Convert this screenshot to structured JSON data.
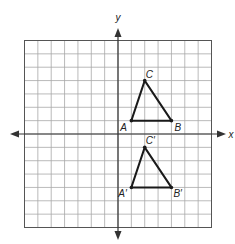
{
  "diagram": {
    "type": "coordinate-plane-transformation",
    "grid": {
      "x_min": -7,
      "x_max": 7,
      "y_min": -7,
      "y_max": 7,
      "cell_px": 13.357,
      "origin_px": [
        118,
        134
      ]
    },
    "axes": {
      "x_label": "x",
      "y_label": "y"
    },
    "colors": {
      "grid": "#a8a8a8",
      "axis": "#333333",
      "triangle": "#1a1a1a"
    },
    "figures": [
      {
        "name": "triangle-ABC",
        "vertices": [
          {
            "label": "A",
            "x": 1,
            "y": 1,
            "label_dx": -11,
            "label_dy": 10
          },
          {
            "label": "B",
            "x": 4,
            "y": 1,
            "label_dx": 3,
            "label_dy": 10
          },
          {
            "label": "C",
            "x": 2,
            "y": 4,
            "label_dx": 1,
            "label_dy": -3
          }
        ]
      },
      {
        "name": "triangle-A'B'C'",
        "vertices": [
          {
            "label": "A′",
            "x": 1,
            "y": -4,
            "label_dx": -13,
            "label_dy": 10
          },
          {
            "label": "B′",
            "x": 4,
            "y": -4,
            "label_dx": 2,
            "label_dy": 10
          },
          {
            "label": "C′",
            "x": 2,
            "y": -1,
            "label_dx": 1,
            "label_dy": -3
          }
        ]
      }
    ]
  }
}
